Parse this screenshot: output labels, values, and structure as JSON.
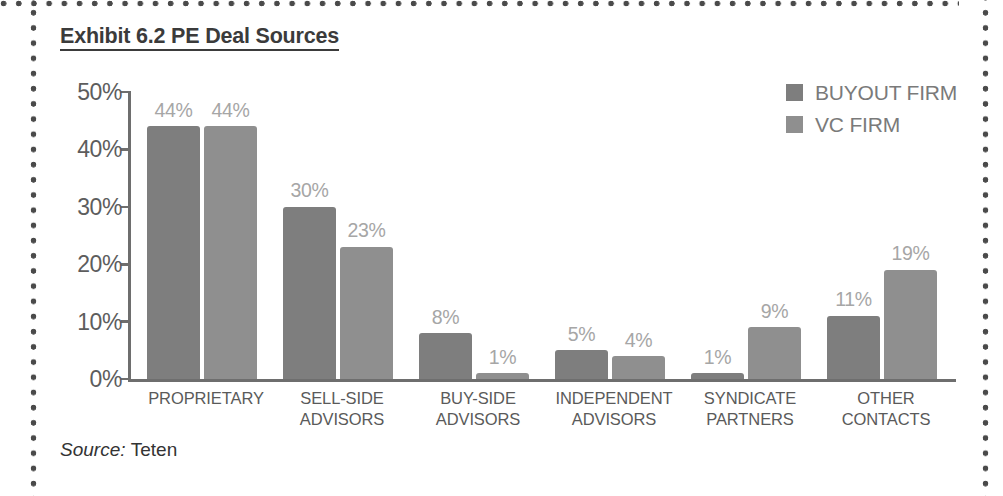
{
  "title": "Exhibit 6.2 PE Deal Sources",
  "source": {
    "label": "Source:",
    "value": "Teten"
  },
  "legend": {
    "position": "top-right",
    "items": [
      {
        "label": "BUYOUT FIRM",
        "color": "#7e7e7e"
      },
      {
        "label": "VC FIRM",
        "color": "#8f8f8f"
      }
    ]
  },
  "axis": {
    "y_ticks": [
      "50%",
      "40%",
      "30%",
      "20%",
      "10%",
      "0%"
    ]
  },
  "chart_data": {
    "type": "bar",
    "title": "Exhibit 6.2 PE Deal Sources",
    "xlabel": "",
    "ylabel": "",
    "ylim": [
      0,
      50
    ],
    "ytick_values": [
      50,
      40,
      30,
      20,
      10,
      0
    ],
    "ytick_labels": [
      "50%",
      "40%",
      "30%",
      "20%",
      "10%",
      "0%"
    ],
    "grid": false,
    "legend_position": "top-right",
    "value_label_format": "{v}%",
    "categories": [
      "PROPRIETARY",
      "SELL-SIDE ADVISORS",
      "BUY-SIDE ADVISORS",
      "INDEPENDENT ADVISORS",
      "SYNDICATE PARTNERS",
      "OTHER CONTACTS"
    ],
    "category_lines": [
      [
        "PROPRIETARY"
      ],
      [
        "SELL-SIDE",
        "ADVISORS"
      ],
      [
        "BUY-SIDE",
        "ADVISORS"
      ],
      [
        "INDEPENDENT",
        "ADVISORS"
      ],
      [
        "SYNDICATE",
        "PARTNERS"
      ],
      [
        "OTHER",
        "CONTACTS"
      ]
    ],
    "series": [
      {
        "name": "BUYOUT FIRM",
        "color": "#7e7e7e",
        "values": [
          44,
          30,
          8,
          5,
          1,
          11
        ],
        "labels": [
          "44%",
          "30%",
          "8%",
          "5%",
          "1%",
          "11%"
        ]
      },
      {
        "name": "VC FIRM",
        "color": "#8f8f8f",
        "values": [
          44,
          23,
          1,
          4,
          9,
          19
        ],
        "labels": [
          "44%",
          "23%",
          "1%",
          "4%",
          "9%",
          "19%"
        ]
      }
    ]
  },
  "layout": {
    "group_left_px": [
      147,
      283,
      419,
      555,
      691,
      827
    ],
    "group_width_px": 118,
    "bar_width_px": 53,
    "bar_gap_px": 4,
    "px_per_percent": 5.74
  }
}
